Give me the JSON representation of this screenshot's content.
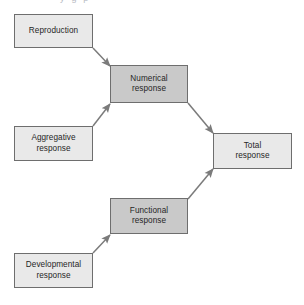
{
  "figure": {
    "type": "flow-diagram",
    "background_color": "#ffffff",
    "clipped_caption_fragment": "y      g  p"
  },
  "palette": {
    "node_light_fill": "#e9e9e9",
    "node_dark_fill": "#c9c9c9",
    "node_border": "#6e6e6e",
    "arrow_color": "#7b7b7b",
    "text_color": "#262626"
  },
  "nodes": [
    {
      "id": "reproduction",
      "label": "Reproduction",
      "style": "light",
      "x": 14,
      "y": 14,
      "w": 79,
      "h": 34
    },
    {
      "id": "aggregative-response",
      "label": "Aggregative\nresponse",
      "style": "light",
      "x": 14,
      "y": 126,
      "w": 79,
      "h": 35
    },
    {
      "id": "developmental-response",
      "label": "Developmental\nresponse",
      "style": "light",
      "x": 14,
      "y": 253,
      "w": 79,
      "h": 35
    },
    {
      "id": "numerical-response",
      "label": "Numerical\nresponse",
      "style": "dark",
      "x": 110,
      "y": 65,
      "w": 78,
      "h": 38
    },
    {
      "id": "functional-response",
      "label": "Functional\nresponse",
      "style": "dark",
      "x": 110,
      "y": 198,
      "w": 78,
      "h": 36
    },
    {
      "id": "total-response",
      "label": "Total\nresponse",
      "style": "light",
      "x": 213,
      "y": 133,
      "w": 79,
      "h": 36
    }
  ],
  "edges": [
    {
      "id": "reproduction-to-numerical",
      "from": "reproduction",
      "to": "numerical-response",
      "x1": 93,
      "y1": 48,
      "x2": 110,
      "y2": 66
    },
    {
      "id": "aggregative-to-numerical",
      "from": "aggregative-response",
      "to": "numerical-response",
      "x1": 93,
      "y1": 126,
      "x2": 110,
      "y2": 104
    },
    {
      "id": "numerical-to-total",
      "from": "numerical-response",
      "to": "total-response",
      "x1": 188,
      "y1": 103,
      "x2": 213,
      "y2": 133
    },
    {
      "id": "functional-to-total",
      "from": "functional-response",
      "to": "total-response",
      "x1": 188,
      "y1": 199,
      "x2": 213,
      "y2": 169
    },
    {
      "id": "developmental-to-functional",
      "from": "developmental-response",
      "to": "functional-response",
      "x1": 93,
      "y1": 253,
      "x2": 110,
      "y2": 235
    }
  ]
}
